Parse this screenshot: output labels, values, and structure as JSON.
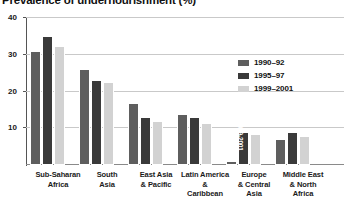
{
  "chart_data": {
    "type": "bar",
    "title": "Prevalence of undernourishment (%)",
    "xlabel": "",
    "ylabel": "",
    "ylim": [
      0,
      40
    ],
    "yticks": [
      10,
      20,
      30,
      40
    ],
    "grid": true,
    "legend_position": "center-right",
    "categories": [
      "Sub-Saharan Africa",
      "South Asia",
      "East Asia & Pacific",
      "Latin America & Caribbean",
      "Europe & Central Asia",
      "Middle East & North Africa"
    ],
    "category_lines": [
      [
        "Sub-Saharan",
        "Africa"
      ],
      [
        "South",
        "Asia"
      ],
      [
        "East Asia",
        "& Pacific"
      ],
      [
        "Latin America",
        "&",
        "Caribbean"
      ],
      [
        "Europe",
        "& Central",
        "Asia"
      ],
      [
        "Middle East",
        "& North",
        "Africa"
      ]
    ],
    "series": [
      {
        "name": "1990–92",
        "color": "#5e5e5e",
        "values": [
          31,
          26,
          17,
          14,
          1,
          7
        ]
      },
      {
        "name": "1995–97",
        "color": "#3a3a3a",
        "values": [
          35,
          23,
          13,
          13,
          9,
          9
        ]
      },
      {
        "name": "1999–2001",
        "color": "#d2d2d2",
        "values": [
          32.5,
          22.5,
          12,
          11.5,
          8.5,
          8
        ]
      }
    ],
    "annotations": [
      {
        "category": "Europe & Central Asia",
        "series": "1995–97",
        "text": "1999-2001",
        "orientation": "vertical",
        "inside_bar": true
      }
    ]
  },
  "colors": {
    "axis": "#555555",
    "gridline": "#c9c9c9",
    "baseline": "#8a8a8a",
    "text": "#1a1a1a",
    "background": "#ffffff"
  }
}
